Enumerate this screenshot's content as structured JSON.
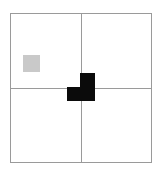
{
  "canvas": {
    "width": 163,
    "height": 173,
    "background_color": "#ffffff",
    "title": "2x2 Grid With Gray Square And Black L Piece"
  },
  "grid": {
    "name": "two-by-two-grid",
    "rows": 2,
    "columns": 2,
    "line_color": "#9a9a9a",
    "line_width": 1,
    "left": 10,
    "top": 13,
    "width": 142,
    "height": 150,
    "center_x": 81,
    "center_y": 88,
    "quadrants": [
      {
        "id": "top-left",
        "label": "Top Left Cell",
        "contains": "gray-square"
      },
      {
        "id": "top-right",
        "label": "Top Right Cell",
        "contains": ""
      },
      {
        "id": "bottom-left",
        "label": "Bottom Left Cell",
        "contains": ""
      },
      {
        "id": "bottom-right",
        "label": "Bottom Right Cell",
        "contains": ""
      }
    ]
  },
  "shapes": [
    {
      "id": "gray-square",
      "name": "gray-square",
      "kind": "square",
      "color": "#c9c9c9",
      "left": 23,
      "top": 55,
      "width": 17,
      "height": 17,
      "quadrant": "top-left"
    },
    {
      "id": "black-piece",
      "name": "black-l-piece",
      "kind": "l-shape",
      "color": "#0b0b0b",
      "left": 67,
      "top": 73,
      "width": 28,
      "height": 28,
      "quadrant": "center-crossing",
      "parts": [
        {
          "id": "stem",
          "name": "vertical-bar",
          "left": 80,
          "top": 73,
          "width": 15,
          "height": 28
        },
        {
          "id": "foot",
          "name": "left-foot",
          "left": 67,
          "top": 87,
          "width": 14,
          "height": 14
        }
      ]
    }
  ]
}
